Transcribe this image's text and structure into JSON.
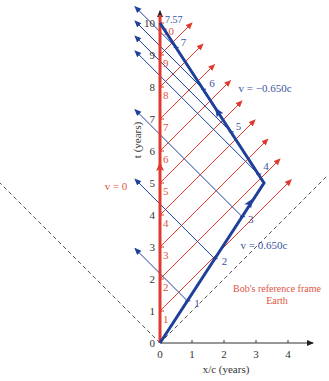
{
  "chart_data": {
    "type": "diagram",
    "xlabel": "x/c (years)",
    "ylabel": "t (years)",
    "x_ticks": [
      "0",
      "1",
      "2",
      "3",
      "4"
    ],
    "t_ticks": [
      "0",
      "1",
      "2",
      "3",
      "4",
      "5",
      "6",
      "7",
      "8",
      "9",
      "10"
    ],
    "earth_tick_labels": [
      "1",
      "2",
      "3",
      "4",
      "5",
      "6",
      "7",
      "8",
      "9",
      "10"
    ],
    "xlim": [
      -5,
      5.2
    ],
    "tlim": [
      0,
      10.3
    ],
    "colors": {
      "earth": "#e0392e",
      "bob": "#1e3f9a",
      "axis": "#333333",
      "light_cone": "#555555",
      "earth_text": "#e05545",
      "bob_text": "#3a55a0"
    },
    "earth_worldline": {
      "label": "v = 0",
      "points": [
        [
          0,
          0
        ],
        [
          0,
          10.25
        ]
      ],
      "arrow_at_t": 5.5
    },
    "bob_worldline": {
      "outbound_label": "v = 0.650c",
      "return_label": "v = −0.650c",
      "points": [
        [
          0,
          0
        ],
        [
          3.25,
          5
        ],
        [
          0,
          10
        ]
      ],
      "arrows": [
        [
          2.81,
          4.375,
          "up-right"
        ],
        [
          1.81,
          7.22,
          "up-left"
        ]
      ],
      "total_proper_time_label": "7.57"
    },
    "bob_ticks": [
      {
        "label": "1",
        "x": 0.855,
        "t": 1.316
      },
      {
        "label": "2",
        "x": 1.71,
        "t": 2.632
      },
      {
        "label": "3",
        "x": 2.566,
        "t": 3.948
      },
      {
        "label": "4",
        "x": 3.07,
        "t": 5.28
      },
      {
        "label": "5",
        "x": 2.21,
        "t": 6.6
      },
      {
        "label": "6",
        "x": 1.35,
        "t": 7.93
      },
      {
        "label": "7",
        "x": 0.49,
        "t": 9.24
      }
    ],
    "earth_signals": [
      {
        "t_emit": 1,
        "x_end": 4.1
      },
      {
        "t_emit": 2,
        "x_end": 3.75
      },
      {
        "t_emit": 3,
        "x_end": 3.37
      },
      {
        "t_emit": 4,
        "x_end": 2.97
      },
      {
        "t_emit": 5,
        "x_end": 2.56
      },
      {
        "t_emit": 6,
        "x_end": 2.2
      },
      {
        "t_emit": 7,
        "x_end": 1.7
      },
      {
        "t_emit": 8,
        "x_end": 1.34
      },
      {
        "t_emit": 9,
        "x_end": 1.0
      }
    ],
    "bob_signal_end_x": -0.78,
    "light_cone": {
      "left_end": [
        -5,
        5
      ],
      "right_end": [
        5.2,
        5.2
      ]
    },
    "annotation": [
      "Bob's reference frame",
      "Earth"
    ]
  }
}
